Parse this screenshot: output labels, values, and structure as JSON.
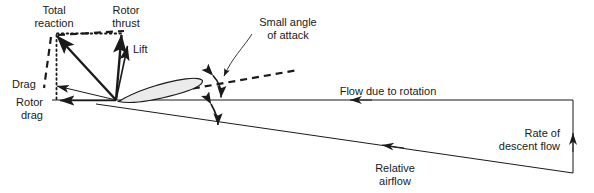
{
  "diagram": {
    "canvas": {
      "width": 594,
      "height": 193
    },
    "background_color": "#ffffff",
    "line_color": "#1a1a1a",
    "airfoil_fill": "#ebebeb"
  },
  "labels": {
    "total_reaction_line1": "Total",
    "total_reaction_line2": "reaction",
    "rotor_thrust_line1": "Rotor",
    "rotor_thrust_line2": "thrust",
    "lift": "Lift",
    "drag": "Drag",
    "rotor_drag_line1": "Rotor",
    "rotor_drag_line2": "drag",
    "small_angle_line1": "Small angle",
    "small_angle_line2": "of attack",
    "flow_due_to_rotation": "Flow due to rotation",
    "relative_airflow_line1": "Relative",
    "relative_airflow_line2": "airflow",
    "rate_of_descent_line1": "Rate of",
    "rate_of_descent_line2": "descent flow"
  },
  "vectors": [
    {
      "name": "total-reaction",
      "style": "solid-thick",
      "from": [
        116,
        100
      ],
      "to": [
        53,
        32
      ]
    },
    {
      "name": "rotor-thrust",
      "style": "solid-thick",
      "from": [
        116,
        100
      ],
      "to": [
        121,
        31
      ]
    },
    {
      "name": "lift",
      "style": "solid-med",
      "from": [
        116,
        100
      ],
      "to": [
        128,
        42
      ]
    },
    {
      "name": "drag",
      "style": "solid-thin",
      "from": [
        116,
        100
      ],
      "to": [
        48,
        85
      ]
    },
    {
      "name": "rotor-drag",
      "style": "solid-med",
      "from": [
        116,
        100
      ],
      "to": [
        50,
        101
      ]
    }
  ],
  "construction_lines": [
    {
      "name": "dotted-horizontal-top",
      "style": "dotted",
      "from": [
        55,
        33
      ],
      "to": [
        122,
        33
      ]
    },
    {
      "name": "dotted-vertical-left",
      "style": "dotted",
      "from": [
        55,
        34
      ],
      "to": [
        55,
        101
      ]
    },
    {
      "name": "dashed-top",
      "style": "dashed",
      "from": [
        56,
        34
      ],
      "to": [
        122,
        32
      ]
    },
    {
      "name": "dashed-left",
      "style": "dashed",
      "from": [
        51,
        36
      ],
      "to": [
        44,
        88
      ]
    }
  ],
  "airflow_lines": [
    {
      "name": "flow-due-to-rotation",
      "from": [
        573,
        100
      ],
      "to": [
        50,
        100
      ],
      "arrow_at": [
        352,
        100
      ]
    },
    {
      "name": "relative-airflow",
      "from": [
        573,
        173
      ],
      "to": [
        95,
        104
      ],
      "arrow_at": [
        382,
        144
      ]
    },
    {
      "name": "rate-of-descent-flow",
      "from": [
        573,
        173
      ],
      "to": [
        573,
        100
      ],
      "arrow_at": [
        573,
        136
      ]
    },
    {
      "name": "chord-extension-dashed",
      "from": [
        120,
        101
      ],
      "to": [
        298,
        70
      ]
    }
  ],
  "angles": [
    {
      "name": "angle-of-attack-arc",
      "label_ref": "small_angle_line1"
    },
    {
      "name": "inflow-angle-arc",
      "label_ref": "small_angle_line2"
    }
  ],
  "airfoil": {
    "name": "rotor-blade-section",
    "leading_edge": [
      118,
      101
    ],
    "trailing_edge": [
      201,
      80
    ],
    "fill": "#ebebeb"
  }
}
